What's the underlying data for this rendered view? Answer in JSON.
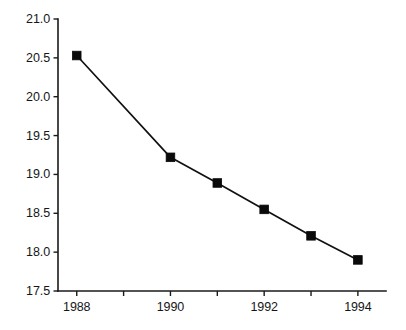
{
  "chart_data": {
    "type": "line",
    "title": "",
    "subtitle": "",
    "xlabel": "",
    "ylabel": "",
    "x": [
      1988,
      1990,
      1991,
      1992,
      1993,
      1994
    ],
    "values": [
      20.53,
      19.22,
      18.89,
      18.55,
      18.21,
      17.9
    ],
    "series": [
      {
        "name": "series-1",
        "x": [
          1988,
          1990,
          1991,
          1992,
          1993,
          1994
        ],
        "values": [
          20.53,
          19.22,
          18.89,
          18.55,
          18.21,
          17.9
        ],
        "marker": "filled-square",
        "color": "#0a0a0a"
      }
    ],
    "xlim": [
      1987.6,
      1994.6
    ],
    "ylim": [
      17.5,
      21.0
    ],
    "x_ticks": [
      1988,
      1989,
      1990,
      1991,
      1992,
      1993,
      1994
    ],
    "x_tick_labels": [
      "1988",
      "",
      "1990",
      "",
      "1992",
      "",
      "1994"
    ],
    "y_ticks": [
      17.5,
      18.0,
      18.5,
      19.0,
      19.5,
      20.0,
      20.5,
      21.0
    ],
    "y_tick_labels": [
      "17.5",
      "18.0",
      "18.5",
      "19.0",
      "19.5",
      "20.0",
      "20.5",
      "21.0"
    ],
    "grid": false,
    "legend": null,
    "legend_position": "none",
    "annotations": [],
    "line_color": "#111111",
    "axis_color": "#1a1a1a",
    "background_color": "#ffffff"
  }
}
